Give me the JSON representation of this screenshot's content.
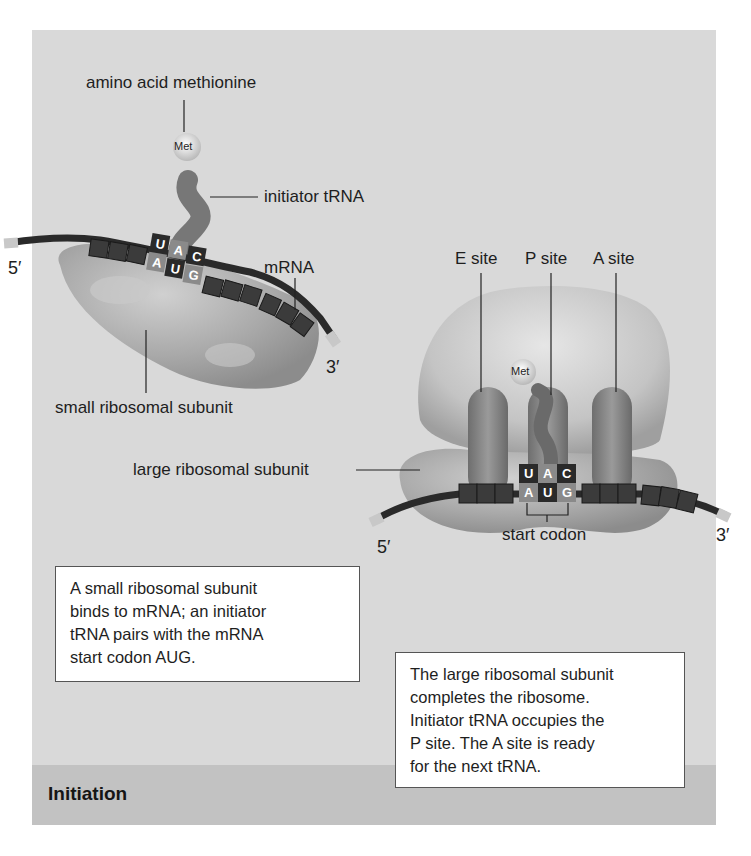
{
  "figure": {
    "footer_title": "Initiation",
    "colors": {
      "panel_bg": "#d9d9d9",
      "footer_bg": "#c2c2c2",
      "ribosome": "#a8a8a8",
      "trna": "#7a7a7a",
      "codon_dark": "#2a2a2a",
      "codon_light": "#8a8a8a",
      "caption_bg": "#ffffff"
    },
    "step1": {
      "labels": {
        "amino_acid": "amino acid methionine",
        "met": "Met",
        "initiator_trna": "initiator tRNA",
        "mrna": "mRNA",
        "five_prime": "5′",
        "three_prime": "3′",
        "small_subunit": "small ribosomal subunit"
      },
      "anticodon": [
        "U",
        "A",
        "C"
      ],
      "codon": [
        "A",
        "U",
        "G"
      ],
      "caption": [
        "A small ribosomal subunit",
        "binds to mRNA; an initiator",
        "tRNA pairs with the mRNA",
        "start codon AUG."
      ]
    },
    "step2": {
      "labels": {
        "e_site": "E site",
        "p_site": "P site",
        "a_site": "A site",
        "met": "Met",
        "large_subunit": "large ribosomal subunit",
        "start_codon": "start codon",
        "five_prime": "5′",
        "three_prime": "3′"
      },
      "anticodon": [
        "U",
        "A",
        "C"
      ],
      "codon": [
        "A",
        "U",
        "G"
      ],
      "caption": [
        "The large ribosomal subunit",
        "completes the ribosome.",
        "Initiator tRNA occupies the",
        "P site. The A site is ready",
        "for the next tRNA."
      ]
    }
  }
}
